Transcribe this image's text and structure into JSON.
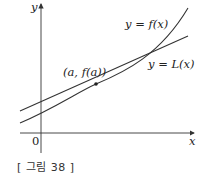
{
  "figure": {
    "caption": "[ 그림 38 ]",
    "axes": {
      "x_label": "x",
      "y_label": "y",
      "origin_label": "0"
    },
    "curves": [
      {
        "name": "f",
        "label": "y = f(x)",
        "type": "convex curve"
      },
      {
        "name": "L",
        "label": "y = L(x)",
        "type": "tangent line at (a, f(a))"
      }
    ],
    "point": {
      "label": "(a, f(a))"
    },
    "colors": {
      "stroke": "#333333",
      "background": "#ffffff"
    }
  }
}
